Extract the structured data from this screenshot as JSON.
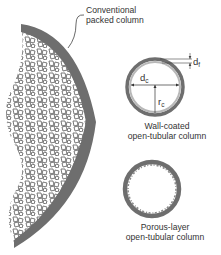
{
  "labels": {
    "packed_line1": "Conventional",
    "packed_line2": "packed column",
    "wall_line1": "Wall-coated",
    "wall_line2": "open-tubular column",
    "porous_line1": "Porous-layer",
    "porous_line2": "open-tubular column"
  },
  "symbols": {
    "film_thickness": "d",
    "film_thickness_sub": "f",
    "column_diameter": "d",
    "column_diameter_sub": "c",
    "column_radius": "r",
    "column_radius_sub": "c"
  },
  "colors": {
    "wall": "#6e6e6e",
    "coating": "#b8b8b8",
    "particles": "#777777",
    "text": "#333333"
  }
}
